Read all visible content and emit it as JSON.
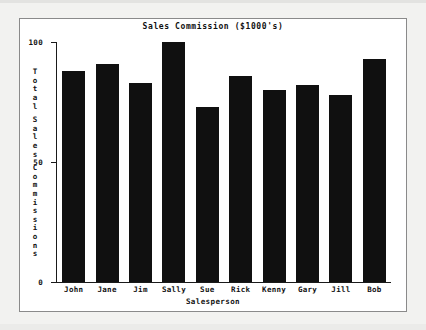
{
  "chart_data": {
    "type": "bar",
    "title": "Sales Commission ($1000's)",
    "xlabel": "Salesperson",
    "ylabel": "Total Sales Commissions",
    "categories": [
      "John",
      "Jane",
      "Jim",
      "Sally",
      "Sue",
      "Rick",
      "Kenny",
      "Gary",
      "Jill",
      "Bob"
    ],
    "values": [
      88,
      91,
      83,
      100,
      73,
      86,
      80,
      82,
      78,
      93
    ],
    "ylim": [
      0,
      100
    ],
    "yticks": [
      0,
      50,
      100
    ],
    "ytick_labels": [
      "0",
      "50",
      "100"
    ],
    "grid": false,
    "legend": "none",
    "bar_color": "#101010",
    "background_color": "#ffffff",
    "axis_color": "#1a1a1a"
  }
}
